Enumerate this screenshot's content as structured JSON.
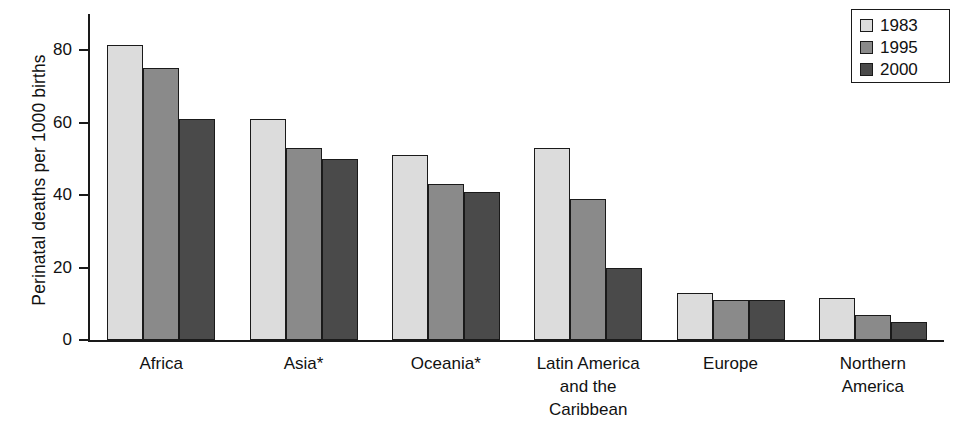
{
  "chart_data": {
    "type": "bar",
    "title": "",
    "subtitle": "",
    "xlabel": "",
    "ylabel": "Perinatal deaths per 1000 births",
    "ylim": [
      0,
      90
    ],
    "yticks": [
      0,
      20,
      40,
      60,
      80
    ],
    "ytick_labels": [
      "0",
      "20",
      "40",
      "60",
      "80"
    ],
    "grid": false,
    "legend_position": "top-right",
    "categories": [
      "Africa",
      "Asia*",
      "Latin America\nand the\nCaribbean",
      "Oceania*",
      "Europe",
      "Northern\nAmerica"
    ],
    "category_labels": [
      [
        "Africa"
      ],
      [
        "Asia*"
      ],
      [
        "Oceania*"
      ],
      [
        "Latin America",
        "and the",
        "Caribbean"
      ],
      [
        "Europe"
      ],
      [
        "Northern",
        "America"
      ]
    ],
    "series": [
      {
        "name": "1983",
        "color": "#dcdcdc",
        "values": [
          81.5,
          61,
          51,
          53,
          13,
          11.5
        ]
      },
      {
        "name": "1995",
        "color": "#8a8a8a",
        "values": [
          75,
          53,
          43,
          39,
          11,
          7
        ]
      },
      {
        "name": "2000",
        "color": "#4a4a4a",
        "values": [
          61,
          50,
          41,
          20,
          11,
          5
        ]
      }
    ],
    "annotations": [
      "* Asia and Oceania exclude Australia, New Zealand and Japan"
    ]
  },
  "legend": {
    "entries": [
      {
        "label": "1983",
        "swatch": "light-gray"
      },
      {
        "label": "1995",
        "swatch": "medium-gray"
      },
      {
        "label": "2000",
        "swatch": "dark-gray"
      }
    ]
  },
  "colors": {
    "series_1983": "#dcdcdc",
    "series_1995": "#8a8a8a",
    "series_2000": "#4a4a4a",
    "axis": "#1a1a1a",
    "text": "#111111",
    "background": "#ffffff"
  }
}
